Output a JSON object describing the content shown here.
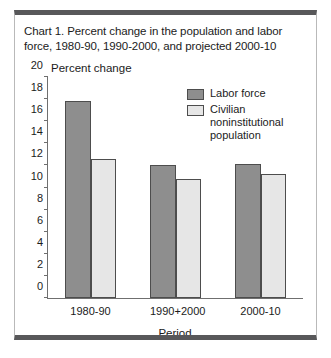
{
  "figure": {
    "title": "Chart 1. Percent change in the population and labor force, 1980-90, 1990-2000, and projected 2000-10"
  },
  "chart_data": {
    "type": "bar",
    "title": "Chart 1. Percent change in the population and labor force, 1980-90, 1990-2000, and projected 2000-10",
    "xlabel": "Period",
    "ylabel": "Percent change",
    "categories": [
      "1980-90",
      "1990+2000",
      "2000-10"
    ],
    "series": [
      {
        "name": "Labor force",
        "color": "#8e8e8e",
        "values": [
          17.8,
          12.0,
          12.1
        ]
      },
      {
        "name": "Civilian noninstitutional population",
        "color": "#e6e6e6",
        "values": [
          12.6,
          10.8,
          11.2
        ]
      }
    ],
    "ylim": [
      0,
      20
    ],
    "yticks": [
      0,
      2,
      4,
      6,
      8,
      10,
      12,
      14,
      16,
      18,
      20
    ],
    "ytick_labels": [
      "0",
      "2",
      "4",
      "6",
      "8",
      "10",
      "12",
      "14",
      "16",
      "18",
      "20"
    ],
    "grid": false,
    "legend_position": "upper right"
  }
}
